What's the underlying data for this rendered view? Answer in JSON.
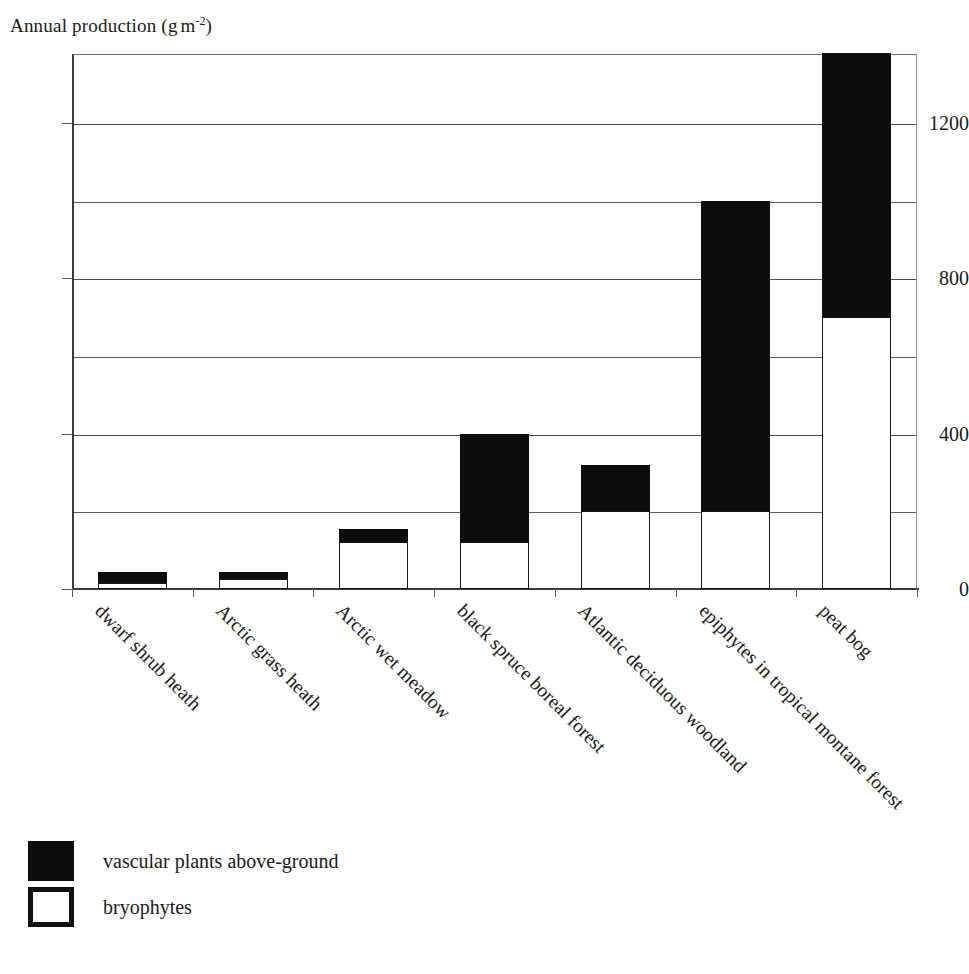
{
  "chart_data": {
    "type": "bar",
    "stacked": true,
    "title_parts": {
      "main": "Annual production (g",
      "unit": "m",
      "exponent": "-2",
      "close": ")"
    },
    "xlabel": "",
    "ylabel": "Annual production (g m-2)",
    "ylim": [
      0,
      1378
    ],
    "ytick_labels": [
      "0",
      "400",
      "800",
      "1200"
    ],
    "ytick_values": [
      0,
      400,
      800,
      1200
    ],
    "gridline_values": [
      200,
      400,
      600,
      800,
      1000,
      1200
    ],
    "grid": true,
    "legend_position": "below-plot",
    "categories": [
      "dwarf shrub heath",
      "Arctic grass heath",
      "Arctic wet meadow",
      "black spruce boreal forest",
      "Atlantic deciduous woodland",
      "epiphytes in tropical montane forest",
      "peat bog"
    ],
    "series": [
      {
        "name": "bryophytes",
        "color": "#ffffff",
        "edge_color": "#151515",
        "values": [
          15,
          25,
          120,
          120,
          200,
          200,
          700
        ]
      },
      {
        "name": "vascular plants above-ground",
        "color": "#0d0d0d",
        "edge_color": "#0d0d0d",
        "values": [
          30,
          20,
          35,
          280,
          120,
          800,
          680
        ]
      }
    ],
    "totals": [
      45,
      45,
      155,
      400,
      320,
      1000,
      1380
    ]
  },
  "legend": {
    "items": [
      {
        "label": "vascular plants above-ground",
        "swatch": "filled"
      },
      {
        "label": "bryophytes",
        "swatch": "hollow"
      }
    ]
  },
  "bottom_fragment": ""
}
